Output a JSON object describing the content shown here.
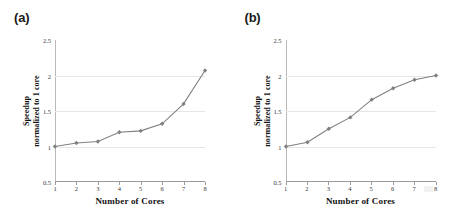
{
  "figure": {
    "panels": [
      {
        "label": "(a)",
        "xlabel": "Number of  Cores",
        "ylabel_line1": "Speedup",
        "ylabel_line2": "normalized  to 1 core"
      },
      {
        "label": "(b)",
        "xlabel": "Number of  Cores",
        "ylabel_line1": "Speedup",
        "ylabel_line2": "normalized  to 1 core"
      }
    ]
  },
  "axis": {
    "ytick_labels": [
      "0.5",
      "1",
      "1.5",
      "2",
      "2.5"
    ],
    "xtick_labels": [
      "1",
      "2",
      "3",
      "4",
      "5",
      "6",
      "7",
      "8"
    ]
  },
  "style": {
    "series_color": "#808080",
    "grid_color": "#e6e6e6",
    "axis_color": "#9a9a9a",
    "text_color": "#1a1a1a",
    "background": "#ffffff"
  },
  "chart_data": [
    {
      "type": "line",
      "title": "(a)",
      "xlabel": "Number of  Cores",
      "ylabel": "Speedup normalized  to 1 core",
      "x": [
        1,
        2,
        3,
        4,
        5,
        6,
        7,
        8
      ],
      "categories": [
        "1",
        "2",
        "3",
        "4",
        "5",
        "6",
        "7",
        "8"
      ],
      "values": [
        1.0,
        1.05,
        1.07,
        1.2,
        1.22,
        1.32,
        1.6,
        2.07
      ],
      "xlim": [
        1,
        8
      ],
      "ylim": [
        0.5,
        2.5
      ],
      "yticks": [
        0.5,
        1,
        1.5,
        2,
        2.5
      ],
      "gridlines_y": [
        1,
        1.5,
        2
      ],
      "grid": true,
      "legend": false,
      "marker": "diamond",
      "color": "#808080"
    },
    {
      "type": "line",
      "title": "(b)",
      "xlabel": "Number of  Cores",
      "ylabel": "Speedup normalized  to 1 core",
      "x": [
        1,
        2,
        3,
        4,
        5,
        6,
        7,
        8
      ],
      "categories": [
        "1",
        "2",
        "3",
        "4",
        "5",
        "6",
        "7",
        "8"
      ],
      "values": [
        1.0,
        1.06,
        1.25,
        1.41,
        1.66,
        1.82,
        1.94,
        2.0
      ],
      "xlim": [
        1,
        8
      ],
      "ylim": [
        0.5,
        2.5
      ],
      "yticks": [
        0.5,
        1,
        1.5,
        2,
        2.5
      ],
      "gridlines_y": [
        1,
        1.5,
        2
      ],
      "grid": true,
      "legend": false,
      "marker": "diamond",
      "color": "#808080"
    }
  ]
}
